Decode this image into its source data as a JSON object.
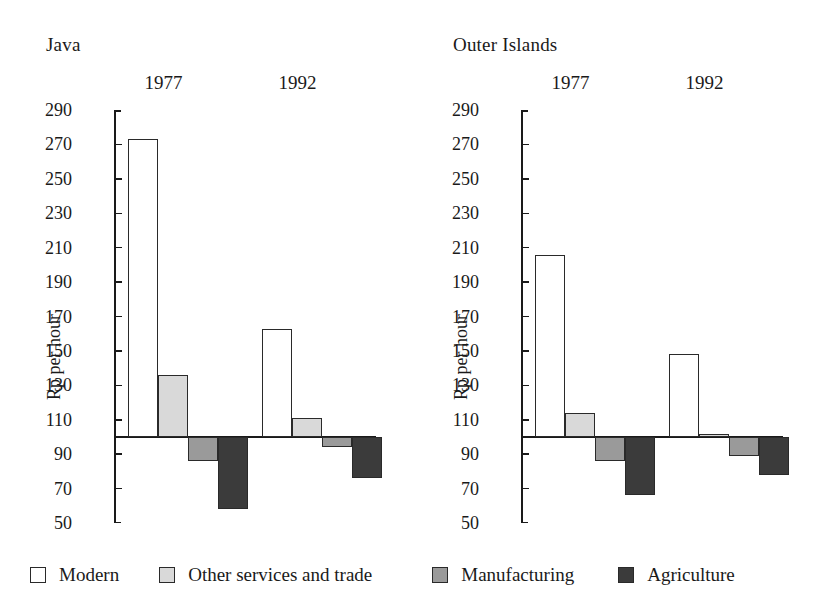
{
  "chart_data": {
    "type": "bar",
    "title": "",
    "ylabel": "Rp per hour",
    "xlabel": "",
    "ylim": [
      50,
      290
    ],
    "baseline": 100,
    "ytick_step": 20,
    "yticks": [
      290,
      270,
      250,
      230,
      210,
      190,
      170,
      150,
      130,
      110,
      90,
      70,
      50
    ],
    "grid": false,
    "legend_position": "bottom",
    "series": [
      {
        "name": "Modern",
        "color": "#ffffff"
      },
      {
        "name": "Other services and trade",
        "color": "#d9d9d9"
      },
      {
        "name": "Manufacturing",
        "color": "#9a9a9a"
      },
      {
        "name": "Agriculture",
        "color": "#3b3b3b"
      }
    ],
    "panels": [
      {
        "title": "Java",
        "ylabel": "Rp per hour",
        "groups": [
          {
            "label": "1977",
            "values": [
              273,
              136,
              86,
              58
            ]
          },
          {
            "label": "1992",
            "values": [
              163,
              111,
              94,
              76
            ]
          }
        ]
      },
      {
        "title": "Outer Islands",
        "ylabel": "Rp per hour",
        "groups": [
          {
            "label": "1977",
            "values": [
              206,
              114,
              86,
              66
            ]
          },
          {
            "label": "1992",
            "values": [
              148,
              102,
              89,
              78
            ]
          }
        ]
      }
    ]
  },
  "legend": {
    "items": [
      {
        "label": "Modern",
        "color": "#ffffff"
      },
      {
        "label": "Other services and trade",
        "color": "#d9d9d9"
      },
      {
        "label": "Manufacturing",
        "color": "#9a9a9a"
      },
      {
        "label": "Agriculture",
        "color": "#3b3b3b"
      }
    ]
  }
}
